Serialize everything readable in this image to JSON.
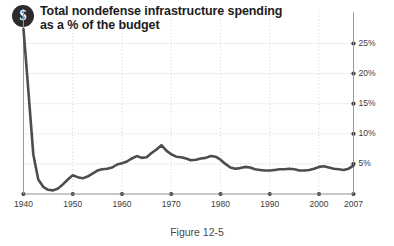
{
  "figure": {
    "badge_icon": "dollar-sign-icon",
    "badge_glyph": "$",
    "title_line1": "Total nondefense infrastructure spending",
    "title_line2": "as a % of the budget",
    "caption": "Figure 12-5"
  },
  "chart_data": {
    "type": "line",
    "xlabel": "",
    "ylabel": "",
    "xlim": [
      1940,
      2007
    ],
    "ylim": [
      0,
      27.5
    ],
    "grid": true,
    "legend": false,
    "y_ticks": [
      5,
      10,
      15,
      20,
      25
    ],
    "y_tick_labels": [
      "5%",
      "10%",
      "15%",
      "20%",
      "25%"
    ],
    "x_ticks": [
      1940,
      1950,
      1960,
      1970,
      1980,
      1990,
      2000,
      2007
    ],
    "x_tick_labels": [
      "1940",
      "1950",
      "1960",
      "1970",
      "1980",
      "1990",
      "2000",
      "2007"
    ],
    "series": [
      {
        "name": "Total nondefense infrastructure spending",
        "color": "#4d4d4d",
        "x": [
          1940,
          1941,
          1942,
          1943,
          1944,
          1945,
          1946,
          1947,
          1948,
          1949,
          1950,
          1951,
          1952,
          1953,
          1954,
          1955,
          1956,
          1957,
          1958,
          1959,
          1960,
          1961,
          1962,
          1963,
          1964,
          1965,
          1966,
          1967,
          1968,
          1969,
          1970,
          1971,
          1972,
          1973,
          1974,
          1975,
          1976,
          1977,
          1978,
          1979,
          1980,
          1981,
          1982,
          1983,
          1984,
          1985,
          1986,
          1987,
          1988,
          1989,
          1990,
          1991,
          1992,
          1993,
          1994,
          1995,
          1996,
          1997,
          1998,
          1999,
          2000,
          2001,
          2002,
          2003,
          2004,
          2005,
          2006,
          2007
        ],
        "values": [
          27.4,
          17.0,
          6.5,
          2.4,
          1.2,
          0.7,
          0.6,
          0.9,
          1.6,
          2.4,
          3.1,
          2.8,
          2.6,
          2.9,
          3.4,
          3.9,
          4.1,
          4.2,
          4.4,
          4.9,
          5.1,
          5.4,
          5.9,
          6.3,
          6.0,
          6.1,
          6.8,
          7.4,
          8.1,
          7.2,
          6.6,
          6.2,
          6.1,
          5.9,
          5.6,
          5.7,
          5.9,
          6.0,
          6.3,
          6.2,
          5.7,
          5.0,
          4.4,
          4.2,
          4.3,
          4.5,
          4.4,
          4.1,
          4.0,
          3.9,
          3.9,
          4.0,
          4.1,
          4.1,
          4.2,
          4.1,
          3.9,
          3.9,
          4.0,
          4.2,
          4.5,
          4.6,
          4.4,
          4.2,
          4.1,
          4.0,
          4.2,
          4.7
        ]
      }
    ]
  }
}
